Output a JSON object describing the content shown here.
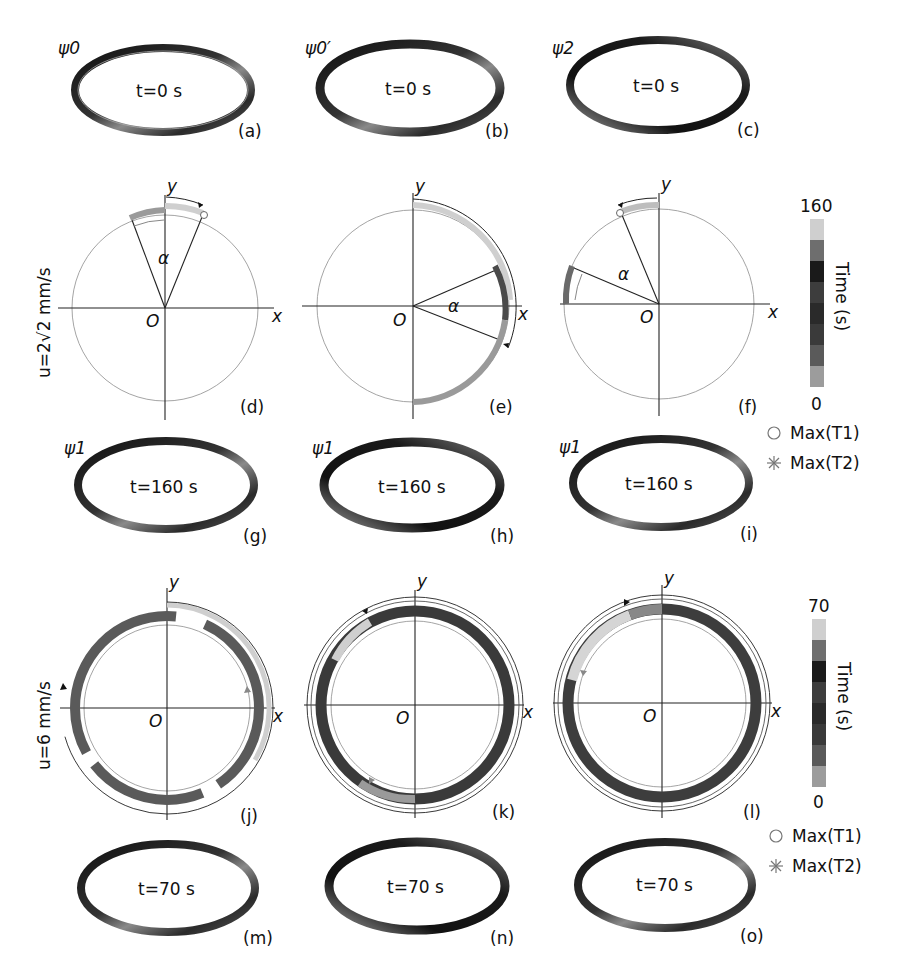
{
  "panels": {
    "a": {
      "label": "(a)",
      "state": "ψ0",
      "time": "t=0 s"
    },
    "b": {
      "label": "(b)",
      "state": "ψ0′",
      "time": "t=0 s"
    },
    "c": {
      "label": "(c)",
      "state": "ψ2",
      "time": "t=0 s"
    },
    "d": {
      "label": "(d)",
      "alpha": "α"
    },
    "e": {
      "label": "(e)",
      "alpha": "α"
    },
    "f": {
      "label": "(f)",
      "alpha": "α"
    },
    "g": {
      "label": "(g)",
      "state": "ψ1",
      "time": "t=160 s"
    },
    "h": {
      "label": "(h)",
      "state": "ψ1",
      "time": "t=160 s"
    },
    "i": {
      "label": "(i)",
      "state": "ψ1",
      "time": "t=160 s"
    },
    "j": {
      "label": "(j)"
    },
    "k": {
      "label": "(k)"
    },
    "l": {
      "label": "(l)"
    },
    "m": {
      "label": "(m)",
      "time": "t=70 s"
    },
    "n": {
      "label": "(n)",
      "time": "t=70 s"
    },
    "o": {
      "label": "(o)",
      "time": "t=70 s"
    }
  },
  "axes": {
    "x": "x",
    "y": "y",
    "origin": "O"
  },
  "rows": {
    "row1_speed": "u=2√2 mm/s",
    "row2_speed": "u=6 mm/s"
  },
  "colorbars": [
    {
      "max": "160",
      "min": "0",
      "title": "Time (s)"
    },
    {
      "max": "70",
      "min": "0",
      "title": "Time (s)"
    }
  ],
  "legend": {
    "t1": "Max(T1)",
    "t2": "Max(T2)",
    "t1_marker": "circle-marker-icon",
    "t2_marker": "asterisk-marker-icon"
  },
  "colors": {
    "ring_dark": "#1a1a1a",
    "ring_mid": "#6b6b6b",
    "ring_light": "#c8c8c8",
    "circle": "#9a9a9a",
    "colorbar": [
      "#9c9c9c",
      "#5a5a5a",
      "#3a3a3a",
      "#2a2a2a",
      "#3d3d3d",
      "#1a1a1a",
      "#6e6e6e",
      "#cfcfcf"
    ]
  }
}
